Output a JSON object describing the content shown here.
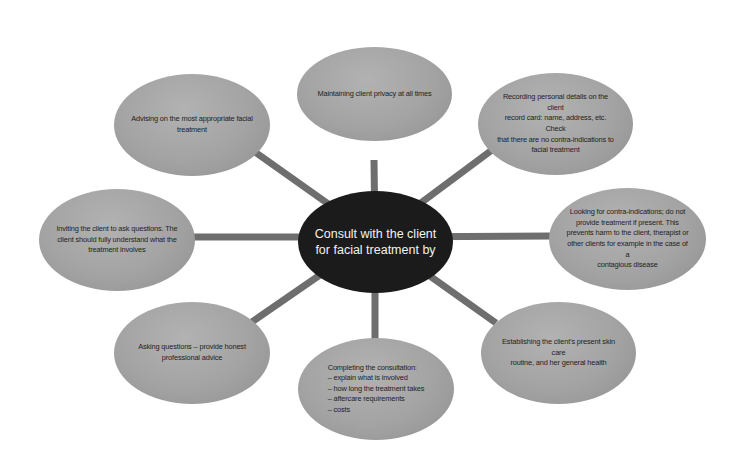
{
  "center": {
    "label": "Consult with the client\nfor facial treatment by"
  },
  "nodes": [
    {
      "id": "top",
      "label": "Maintaining client privacy at all times"
    },
    {
      "id": "top-right",
      "label": "Recording personal details on the client\nrecord card: name, address, etc. Check\nthat there are no contra-indications to\nfacial treatment"
    },
    {
      "id": "right",
      "label": "Looking for contra-indications; do not\nprovide treatment if present. This\nprevents harm to the client, therapist or\nother clients for example in the case of a\ncontagious disease"
    },
    {
      "id": "bottom-right",
      "label": "Establishing the client's present skin care\nroutine, and her general health"
    },
    {
      "id": "bottom",
      "label": "Completing the consultation:\n– explain what is involved\n– how long the treatment takes\n– aftercare requirements\n– costs"
    },
    {
      "id": "bottom-left",
      "label": "Asking questions – provide honest\nprofessional advice"
    },
    {
      "id": "left",
      "label": "Inviting the client to ask questions. The\nclient should fully understand what the\ntreatment involves"
    },
    {
      "id": "top-left",
      "label": "Advising on the most appropriate facial\ntreatment"
    }
  ],
  "colors": {
    "center_fill": "#1b1b1b",
    "outer_fill": "#a3a3a3",
    "spoke": "#6e6e6e",
    "background": "#ffffff"
  }
}
